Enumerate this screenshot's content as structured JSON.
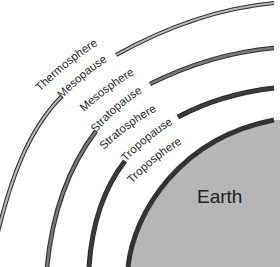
{
  "diagram": {
    "title": "",
    "center_label": "Earth",
    "layers": [
      {
        "name": "Thermosphere",
        "kind": "layer"
      },
      {
        "name": "Mesopause",
        "kind": "boundary"
      },
      {
        "name": "Mesosphere",
        "kind": "layer"
      },
      {
        "name": "Stratopause",
        "kind": "boundary"
      },
      {
        "name": "Stratosphere",
        "kind": "layer"
      },
      {
        "name": "Tropopause",
        "kind": "boundary"
      },
      {
        "name": "Troposphere",
        "kind": "layer"
      }
    ],
    "colors": {
      "mesopause_fill": "#b9b9b9",
      "stratopause_fill": "#7a7a7a",
      "tropopause_fill": "#3c3c3c",
      "earth_edge": "#333333",
      "earth_fill": "#b6b6b6",
      "outline": "#2e2e2e",
      "text": "#2a2a2a"
    }
  }
}
